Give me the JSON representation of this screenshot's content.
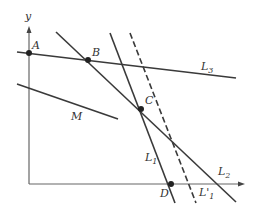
{
  "diagram": {
    "axes": {
      "x_label": "",
      "y_label": "y"
    },
    "points": {
      "A": "A",
      "B": "B",
      "C": "C",
      "D": "D"
    },
    "lines": {
      "L1": {
        "name": "L",
        "sub": "1"
      },
      "L1_prime": {
        "name": "L'",
        "sub": "1"
      },
      "L2": {
        "name": "L",
        "sub": "2"
      },
      "L3": {
        "name": "L",
        "sub": "3"
      },
      "M": {
        "name": "M"
      }
    },
    "colors": {
      "line": "#3a3a3a",
      "axis": "#555555",
      "point": "#222222"
    }
  }
}
